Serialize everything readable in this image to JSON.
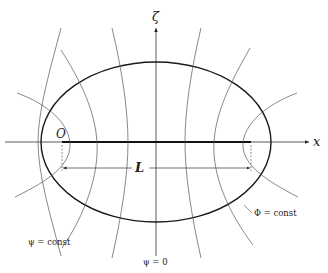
{
  "figure": {
    "axes": {
      "x_label": "x",
      "vertical_label": "ζ"
    },
    "origin_label": "O",
    "length_label": "L",
    "annotations": {
      "potential_lines": "Φ = const",
      "stream_lines": "ψ = const",
      "center_stream_line": "ψ = 0"
    },
    "colors": {
      "ink": "#222222",
      "thin_line": "#444444",
      "background": "#ffffff"
    }
  }
}
